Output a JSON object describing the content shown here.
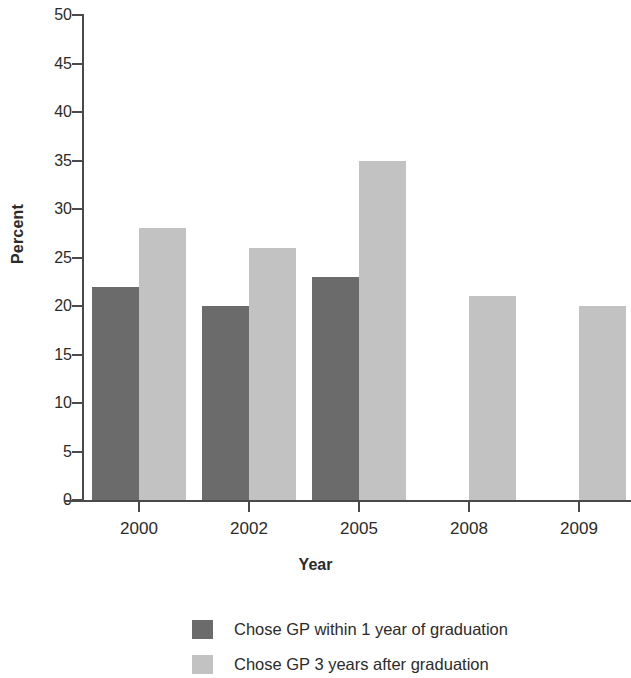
{
  "chart_data": {
    "type": "bar",
    "title": "",
    "subtitle": "",
    "xlabel": "Year",
    "ylabel": "Percent",
    "categories": [
      "2000",
      "2002",
      "2005",
      "2008",
      "2009"
    ],
    "series": [
      {
        "name": "Chose GP within 1 year of graduation",
        "color": "#6b6b6b",
        "values": [
          22,
          20,
          23,
          null,
          null
        ]
      },
      {
        "name": "Chose GP 3 years after graduation",
        "color": "#c2c2c2",
        "values": [
          28,
          26,
          35,
          21,
          20
        ]
      }
    ],
    "ylim": [
      0,
      50
    ],
    "ytick_labels": [
      "0",
      "5",
      "10",
      "15",
      "20",
      "25",
      "30",
      "35",
      "40",
      "45",
      "50"
    ],
    "ytick_values": [
      0,
      5,
      10,
      15,
      20,
      25,
      30,
      35,
      40,
      45,
      50
    ],
    "grid": false,
    "legend_position": "bottom"
  },
  "axis": {
    "ylabel": "Percent",
    "xlabel": "Year"
  },
  "legend": {
    "entries": [
      {
        "label": "Chose GP within 1 year of graduation",
        "color": "#6b6b6b"
      },
      {
        "label": "Chose GP 3 years after graduation",
        "color": "#c2c2c2"
      }
    ]
  }
}
